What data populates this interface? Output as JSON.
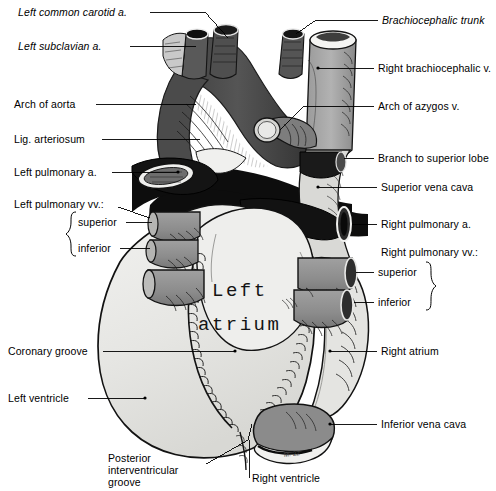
{
  "figure": {
    "palette": {
      "paper": "#ffffff",
      "ink": "#000000",
      "artery_dark": "#4a4a4a",
      "vein_mid": "#8c8c8c",
      "vein_light": "#a8a8a8",
      "myocardium": "#e8e8e6",
      "shadow_black": "#0d0d0d",
      "highlight": "#f6f6f4",
      "stump_grey": "#8f8f8f"
    },
    "handwritten": {
      "line1": "Left",
      "line2": "atrium"
    },
    "initials": "M. 22"
  },
  "labels": {
    "left": [
      {
        "id": "left-common-carotid-artery",
        "text": "Left common carotid a.",
        "italic": true,
        "x": 18,
        "y": 6,
        "leader": {
          "x1": 150,
          "y1": 12,
          "x2": 205,
          "y2": 12,
          "x3": 228,
          "y3": 38
        }
      },
      {
        "id": "left-subclavian-artery",
        "text": "Left subclavian a.",
        "italic": true,
        "x": 18,
        "y": 40,
        "leader": {
          "x1": 130,
          "y1": 46,
          "x2": 196,
          "y2": 46,
          "x3": 196,
          "y3": 46
        }
      },
      {
        "id": "arch-of-aorta",
        "text": "Arch of aorta",
        "italic": false,
        "x": 14,
        "y": 98,
        "leader": {
          "x1": 96,
          "y1": 104,
          "x2": 196,
          "y2": 104,
          "x3": 196,
          "y3": 104
        }
      },
      {
        "id": "ligamentum-arteriosum",
        "text": "Lig. arteriosum",
        "italic": false,
        "x": 14,
        "y": 133,
        "leader": {
          "x1": 102,
          "y1": 139,
          "x2": 200,
          "y2": 139,
          "x3": 200,
          "y3": 139
        }
      },
      {
        "id": "left-pulmonary-artery",
        "text": "Left pulmonary a.",
        "italic": false,
        "x": 14,
        "y": 166,
        "leader": {
          "x1": 112,
          "y1": 172,
          "x2": 178,
          "y2": 172,
          "x3": 178,
          "y3": 172
        }
      },
      {
        "id": "left-pulmonary-veins",
        "text": "Left pulmonary vv.:",
        "italic": false,
        "x": 14,
        "y": 198,
        "leader": {
          "x1": 118,
          "y1": 207,
          "x2": 150,
          "y2": 218,
          "x3": 150,
          "y3": 218
        }
      },
      {
        "id": "left-pulmonary-vein-superior",
        "text": "superior",
        "italic": false,
        "x": 78,
        "y": 216,
        "leader": {
          "x1": 126,
          "y1": 222,
          "x2": 152,
          "y2": 222,
          "x3": 152,
          "y3": 222
        }
      },
      {
        "id": "left-pulmonary-vein-inferior",
        "text": "inferior",
        "italic": false,
        "x": 78,
        "y": 242,
        "leader": {
          "x1": 120,
          "y1": 248,
          "x2": 150,
          "y2": 248,
          "x3": 150,
          "y3": 248
        }
      },
      {
        "id": "coronary-groove",
        "text": "Coronary groove",
        "italic": false,
        "x": 8,
        "y": 345,
        "leader": {
          "x1": 103,
          "y1": 351,
          "x2": 235,
          "y2": 351,
          "x3": 235,
          "y3": 351
        }
      },
      {
        "id": "left-ventricle",
        "text": "Left ventricle",
        "italic": false,
        "x": 8,
        "y": 392,
        "leader": {
          "x1": 88,
          "y1": 398,
          "x2": 145,
          "y2": 398,
          "x3": 145,
          "y3": 398
        }
      }
    ],
    "right": [
      {
        "id": "brachiocephalic-trunk",
        "text": "Brachiocephalic trunk",
        "italic": true,
        "x": 382,
        "y": 14,
        "leader": {
          "x1": 378,
          "y1": 20,
          "x2": 316,
          "y2": 20,
          "x3": 296,
          "y3": 34
        }
      },
      {
        "id": "right-brachiocephalic-vein",
        "text": "Right brachiocephalic v.",
        "italic": false,
        "x": 378,
        "y": 62,
        "leader": {
          "x1": 374,
          "y1": 68,
          "x2": 318,
          "y2": 68,
          "x3": 318,
          "y3": 68
        }
      },
      {
        "id": "arch-of-azygos-vein",
        "text": "Arch of azygos v.",
        "italic": false,
        "x": 378,
        "y": 100,
        "leader": {
          "x1": 374,
          "y1": 106,
          "x2": 304,
          "y2": 106,
          "x3": 286,
          "y3": 128
        }
      },
      {
        "id": "branch-to-superior-lobe",
        "text": "Branch to superior lobe",
        "italic": false,
        "x": 378,
        "y": 152,
        "leader": {
          "x1": 374,
          "y1": 158,
          "x2": 344,
          "y2": 158,
          "x3": 344,
          "y3": 158
        }
      },
      {
        "id": "superior-vena-cava",
        "text": "Superior vena cava",
        "italic": false,
        "x": 381,
        "y": 181,
        "leader": {
          "x1": 377,
          "y1": 187,
          "x2": 318,
          "y2": 187,
          "x3": 318,
          "y3": 187
        }
      },
      {
        "id": "right-pulmonary-artery",
        "text": "Right pulmonary a.",
        "italic": false,
        "x": 381,
        "y": 218,
        "leader": {
          "x1": 377,
          "y1": 224,
          "x2": 352,
          "y2": 224,
          "x3": 352,
          "y3": 224
        }
      },
      {
        "id": "right-pulmonary-veins",
        "text": "Right pulmonary vv.:",
        "italic": false,
        "x": 381,
        "y": 246,
        "leader": null
      },
      {
        "id": "right-pulmonary-vein-superior",
        "text": "superior",
        "italic": false,
        "x": 378,
        "y": 266,
        "leader": {
          "x1": 374,
          "y1": 272,
          "x2": 356,
          "y2": 272,
          "x3": 356,
          "y3": 272
        }
      },
      {
        "id": "right-pulmonary-vein-inferior",
        "text": "inferior",
        "italic": false,
        "x": 378,
        "y": 296,
        "leader": {
          "x1": 374,
          "y1": 302,
          "x2": 354,
          "y2": 302,
          "x3": 354,
          "y3": 302
        }
      },
      {
        "id": "right-atrium",
        "text": "Right atrium",
        "italic": false,
        "x": 381,
        "y": 345,
        "leader": {
          "x1": 377,
          "y1": 351,
          "x2": 330,
          "y2": 351,
          "x3": 330,
          "y3": 351
        }
      },
      {
        "id": "inferior-vena-cava",
        "text": "Inferior vena cava",
        "italic": false,
        "x": 381,
        "y": 418,
        "leader": {
          "x1": 377,
          "y1": 424,
          "x2": 330,
          "y2": 424,
          "x3": 330,
          "y3": 424
        }
      }
    ],
    "bottom": [
      {
        "id": "posterior-interventricular-groove-l1",
        "text": "Posterior",
        "italic": false,
        "x": 108,
        "y": 452
      },
      {
        "id": "posterior-interventricular-groove-l2",
        "text": "interventricular",
        "italic": false,
        "x": 108,
        "y": 464
      },
      {
        "id": "posterior-interventricular-groove-l3",
        "text": "groove",
        "italic": false,
        "x": 108,
        "y": 476
      },
      {
        "id": "right-ventricle",
        "text": "Right ventricle",
        "italic": false,
        "x": 252,
        "y": 472
      }
    ]
  },
  "braces": {
    "left_pulmonary_vv": {
      "orientation": "left",
      "x": 70,
      "y": 212,
      "height": 44
    },
    "right_pulmonary_vv": {
      "orientation": "right",
      "x": 432,
      "y": 262,
      "height": 46
    }
  }
}
